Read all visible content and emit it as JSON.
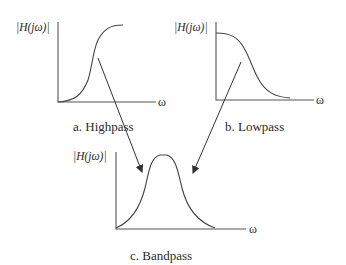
{
  "diagram": {
    "panels": [
      {
        "id": "highpass",
        "y_label": "|H(jω)|",
        "x_label": "ω",
        "caption": "a. Highpass"
      },
      {
        "id": "lowpass",
        "y_label": "|H(jω)|",
        "x_label": "ω",
        "caption": "b. Lowpass"
      },
      {
        "id": "bandpass",
        "y_label": "|H(jω)|",
        "x_label": "ω",
        "caption": "c. Bandpass"
      }
    ],
    "arrows": [
      {
        "from": "highpass",
        "to": "bandpass"
      },
      {
        "from": "lowpass",
        "to": "bandpass"
      }
    ],
    "colors": {
      "line": "#444444",
      "background": "#ffffff"
    }
  }
}
